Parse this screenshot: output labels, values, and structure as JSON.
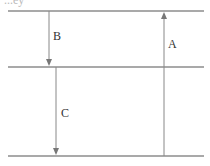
{
  "diagram": {
    "top_text_fragment": "...ey",
    "levels": [
      {
        "name": "level-top",
        "y": 11
      },
      {
        "name": "level-middle",
        "y": 67
      },
      {
        "name": "level-bottom",
        "y": 156
      }
    ],
    "arrows": [
      {
        "label": "A",
        "direction": "up",
        "from": "level-bottom",
        "to": "level-top"
      },
      {
        "label": "B",
        "direction": "down",
        "from": "level-top",
        "to": "level-middle"
      },
      {
        "label": "C",
        "direction": "down",
        "from": "level-middle",
        "to": "level-bottom"
      }
    ],
    "colors": {
      "line": "#555555",
      "arrow": "#888888",
      "text": "#333333"
    }
  }
}
